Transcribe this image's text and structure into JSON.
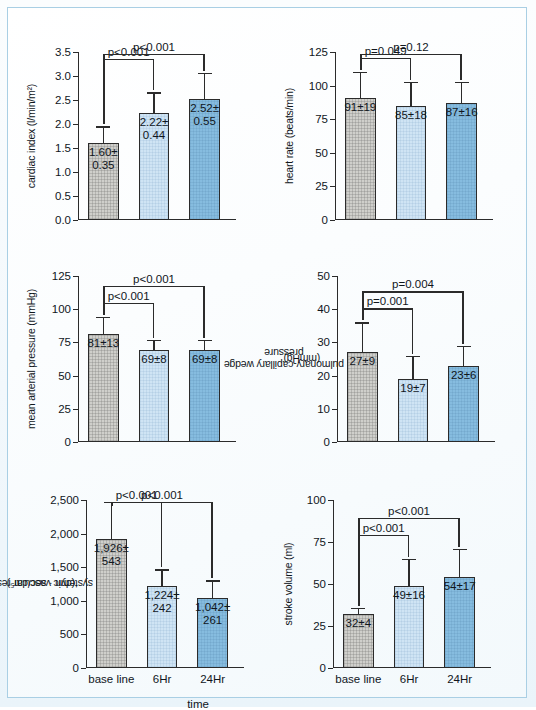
{
  "figure": {
    "xlabel": "time",
    "categories": [
      "base line",
      "6Hr",
      "24Hr"
    ],
    "bar_colors": [
      "#cfcfcb",
      "#cfe4f4",
      "#86bcdf"
    ],
    "frame_color": "#a9cfe4",
    "background": "#f3f9fc"
  },
  "chart_data": [
    {
      "type": "bar",
      "id": "cardiac-index",
      "title": "",
      "ylabel": "cardiac index (l/min/m²)",
      "xlabel": "",
      "categories": [
        "base line",
        "6Hr",
        "24Hr"
      ],
      "values": [
        1.6,
        2.22,
        2.52
      ],
      "errors": [
        0.35,
        0.44,
        0.55
      ],
      "labels": [
        "1.60± 0.35",
        "2.22± 0.44",
        "2.52± 0.55"
      ],
      "label_lines": [
        [
          "1.60±",
          "0.35"
        ],
        [
          "2.22±",
          "0.44"
        ],
        [
          "2.52±",
          "0.55"
        ]
      ],
      "ylim": [
        0,
        3.5
      ],
      "yticks": [
        "0.0",
        "0.5",
        "1.0",
        "1.5",
        "2.0",
        "2.5",
        "3.0",
        "3.5"
      ],
      "ytick_values": [
        0,
        0.5,
        1.0,
        1.5,
        2.0,
        2.5,
        3.0,
        3.5
      ],
      "grid": false,
      "annotations": [
        {
          "text": "p<0.001",
          "from": 0,
          "to": 1
        },
        {
          "text": "p<0.001",
          "from": 0,
          "to": 2
        }
      ]
    },
    {
      "type": "bar",
      "id": "heart-rate",
      "title": "",
      "ylabel": "heart rate (beats/min)",
      "xlabel": "",
      "categories": [
        "base line",
        "6Hr",
        "24Hr"
      ],
      "values": [
        91,
        85,
        87
      ],
      "errors": [
        19,
        18,
        16
      ],
      "labels": [
        "91±19",
        "85±18",
        "87±16"
      ],
      "label_lines": [
        [
          "91±19"
        ],
        [
          "85±18"
        ],
        [
          "87±16"
        ]
      ],
      "ylim": [
        0,
        125
      ],
      "yticks": [
        "0",
        "25",
        "50",
        "75",
        "100",
        "125"
      ],
      "ytick_values": [
        0,
        25,
        50,
        75,
        100,
        125
      ],
      "grid": false,
      "annotations": [
        {
          "text": "p=0.049",
          "from": 0,
          "to": 1
        },
        {
          "text": "p=0.12",
          "from": 0,
          "to": 2
        }
      ]
    },
    {
      "type": "bar",
      "id": "mean-arterial-pressure",
      "title": "",
      "ylabel": "mean arterial pressure (mmHg)",
      "xlabel": "",
      "categories": [
        "base line",
        "6Hr",
        "24Hr"
      ],
      "values": [
        81,
        69,
        69
      ],
      "errors": [
        13,
        8,
        8
      ],
      "labels": [
        "81±13",
        "69±8",
        "69±8"
      ],
      "label_lines": [
        [
          "81±13"
        ],
        [
          "69±8"
        ],
        [
          "69±8"
        ]
      ],
      "ylim": [
        0,
        125
      ],
      "yticks": [
        "0",
        "25",
        "50",
        "75",
        "100",
        "125"
      ],
      "ytick_values": [
        0,
        25,
        50,
        75,
        100,
        125
      ],
      "grid": false,
      "annotations": [
        {
          "text": "p<0.001",
          "from": 0,
          "to": 1
        },
        {
          "text": "p<0.001",
          "from": 0,
          "to": 2
        }
      ]
    },
    {
      "type": "bar",
      "id": "pulmonary-capillary-wedge-pressure",
      "title": "",
      "ylabel": "pulmonary-capillary wedge pressure (mmHg)",
      "ylabel_lines": [
        "pulmonary-capillary wedge pressure",
        "(mmHg)"
      ],
      "xlabel": "",
      "categories": [
        "base line",
        "6Hr",
        "24Hr"
      ],
      "values": [
        27,
        19,
        23
      ],
      "errors": [
        9,
        7,
        6
      ],
      "labels": [
        "27±9",
        "19±7",
        "23±6"
      ],
      "label_lines": [
        [
          "27±9"
        ],
        [
          "19±7"
        ],
        [
          "23±6"
        ]
      ],
      "ylim": [
        0,
        50
      ],
      "yticks": [
        "0",
        "10",
        "20",
        "30",
        "40",
        "50"
      ],
      "ytick_values": [
        0,
        10,
        20,
        30,
        40,
        50
      ],
      "grid": false,
      "annotations": [
        {
          "text": "p=0.001",
          "from": 0,
          "to": 1
        },
        {
          "text": "p=0.004",
          "from": 0,
          "to": 2
        }
      ]
    },
    {
      "type": "bar",
      "id": "systemic-vascular-resistance",
      "title": "",
      "ylabel": "systemic vascular resistance (dyn · sec/cm⁵)",
      "ylabel_lines": [
        "systemic vascular resistance",
        "(dyn · sec/cm⁵)"
      ],
      "xlabel": "time",
      "categories": [
        "base line",
        "6Hr",
        "24Hr"
      ],
      "values": [
        1926,
        1224,
        1042
      ],
      "errors": [
        543,
        242,
        261
      ],
      "labels": [
        "1,926± 543",
        "1,224± 242",
        "1,042± 261"
      ],
      "label_lines": [
        [
          "1,926±",
          "543"
        ],
        [
          "1,224±",
          "242"
        ],
        [
          "1,042±",
          "261"
        ]
      ],
      "ylim": [
        0,
        2500
      ],
      "yticks": [
        "0",
        "500",
        "1,000",
        "1,500",
        "2,000",
        "2,500"
      ],
      "ytick_values": [
        0,
        500,
        1000,
        1500,
        2000,
        2500
      ],
      "grid": false,
      "annotations": [
        {
          "text": "p<0.001",
          "from": 0,
          "to": 1
        },
        {
          "text": "p<0.001",
          "from": 0,
          "to": 2
        }
      ]
    },
    {
      "type": "bar",
      "id": "stroke-volume",
      "title": "",
      "ylabel": "stroke volume (ml)",
      "xlabel": "",
      "categories": [
        "base line",
        "6Hr",
        "24Hr"
      ],
      "values": [
        32,
        49,
        54
      ],
      "errors": [
        4,
        16,
        17
      ],
      "labels": [
        "32±4",
        "49±16",
        "54±17"
      ],
      "label_lines": [
        [
          "32±4"
        ],
        [
          "49±16"
        ],
        [
          "54±17"
        ]
      ],
      "ylim": [
        0,
        100
      ],
      "yticks": [
        "0",
        "25",
        "50",
        "75",
        "100"
      ],
      "ytick_values": [
        0,
        25,
        50,
        75,
        100
      ],
      "grid": false,
      "annotations": [
        {
          "text": "p<0.001",
          "from": 0,
          "to": 1
        },
        {
          "text": "p<0.001",
          "from": 0,
          "to": 2
        }
      ]
    }
  ]
}
